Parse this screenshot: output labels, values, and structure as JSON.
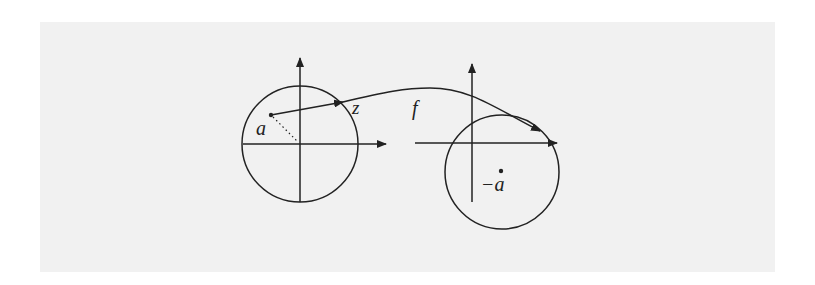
{
  "diagram": {
    "background_color": "#f1f1f1",
    "stroke_color": "#222222",
    "labels": {
      "point_a": "a",
      "point_z": "z",
      "map_f": "f",
      "point_neg_a": "−a"
    },
    "left_plane": {
      "circle": {
        "cx": 300,
        "cy": 144,
        "r": 58
      },
      "origin": {
        "x": 300,
        "y": 144
      },
      "point_a": {
        "x": 271,
        "y": 115
      },
      "point_z": {
        "x": 343,
        "y": 102
      }
    },
    "right_plane": {
      "circle": {
        "cx": 502,
        "cy": 172,
        "r": 57
      },
      "origin": {
        "x": 472,
        "y": 143
      },
      "point_neg_a": {
        "x": 501,
        "y": 171
      }
    }
  }
}
